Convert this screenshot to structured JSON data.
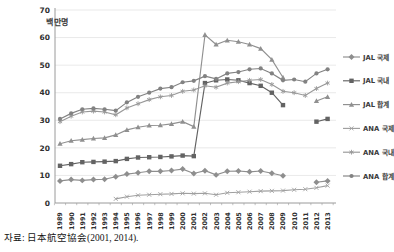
{
  "source_note": "자료: 日本航空協会(2001, 2014).",
  "chart_data": {
    "type": "line",
    "title": "",
    "ylabel": "백만명",
    "xlabel": "",
    "ylim": [
      0,
      70
    ],
    "ytick_step": 10,
    "grid": true,
    "legend_position": "right",
    "x": [
      "1989",
      "1990",
      "1991",
      "1992",
      "1993",
      "1994",
      "1995",
      "1996",
      "1997",
      "1998",
      "1999",
      "2000",
      "2001",
      "2002",
      "2003",
      "2004",
      "2005",
      "2006",
      "2007",
      "2008",
      "2009",
      "2010",
      "2011",
      "2012",
      "2013"
    ],
    "series": [
      {
        "name": "JAL 국제",
        "marker": "diamond",
        "color": "#8e8e8e",
        "values": [
          8.0,
          8.5,
          8.2,
          8.5,
          8.6,
          9.5,
          10.5,
          11.0,
          11.5,
          11.5,
          11.8,
          12.3,
          10.7,
          11.7,
          10.2,
          11.5,
          11.6,
          11.3,
          11.6,
          10.8,
          9.9,
          null,
          null,
          7.5,
          8.0
        ]
      },
      {
        "name": "JAL 국내",
        "marker": "square",
        "color": "#636363",
        "values": [
          13.5,
          14.1,
          14.8,
          14.9,
          15.0,
          15.2,
          16.0,
          16.5,
          16.6,
          16.7,
          16.9,
          17.2,
          17.0,
          43.5,
          44.5,
          44.8,
          44.5,
          43.5,
          42.5,
          40.0,
          35.5,
          null,
          null,
          29.5,
          30.5
        ]
      },
      {
        "name": "JAL 합계",
        "marker": "triangle",
        "color": "#909090",
        "values": [
          21.5,
          22.6,
          23.0,
          23.4,
          23.6,
          24.7,
          26.5,
          27.5,
          28.1,
          28.2,
          28.7,
          29.5,
          27.7,
          61.0,
          57.5,
          59.0,
          58.5,
          57.5,
          56.0,
          52.0,
          45.5,
          null,
          null,
          37.0,
          38.5
        ]
      },
      {
        "name": "ANA 국제",
        "marker": "x",
        "color": "#a0a0a0",
        "values": [
          null,
          null,
          null,
          null,
          null,
          1.5,
          2.3,
          2.8,
          3.0,
          3.2,
          3.3,
          3.5,
          3.4,
          3.5,
          3.0,
          3.7,
          3.9,
          4.1,
          4.3,
          4.4,
          4.5,
          4.8,
          5.0,
          5.5,
          6.3
        ]
      },
      {
        "name": "ANA 국내",
        "marker": "asterisk",
        "color": "#989898",
        "values": [
          29.5,
          31.5,
          33.0,
          33.3,
          33.0,
          32.0,
          34.5,
          36.0,
          37.5,
          38.5,
          39.0,
          40.5,
          41.0,
          42.5,
          42.0,
          43.5,
          44.0,
          44.5,
          44.8,
          43.0,
          40.5,
          40.0,
          39.0,
          41.5,
          43.5
        ]
      },
      {
        "name": "ANA 합계",
        "marker": "circle",
        "color": "#828282",
        "values": [
          30.5,
          32.5,
          34.0,
          34.3,
          34.0,
          33.5,
          36.5,
          38.5,
          40.0,
          41.5,
          42.0,
          43.8,
          44.3,
          46.0,
          45.0,
          47.0,
          47.5,
          48.5,
          48.8,
          47.0,
          44.5,
          44.8,
          44.0,
          47.0,
          48.5
        ]
      }
    ]
  }
}
